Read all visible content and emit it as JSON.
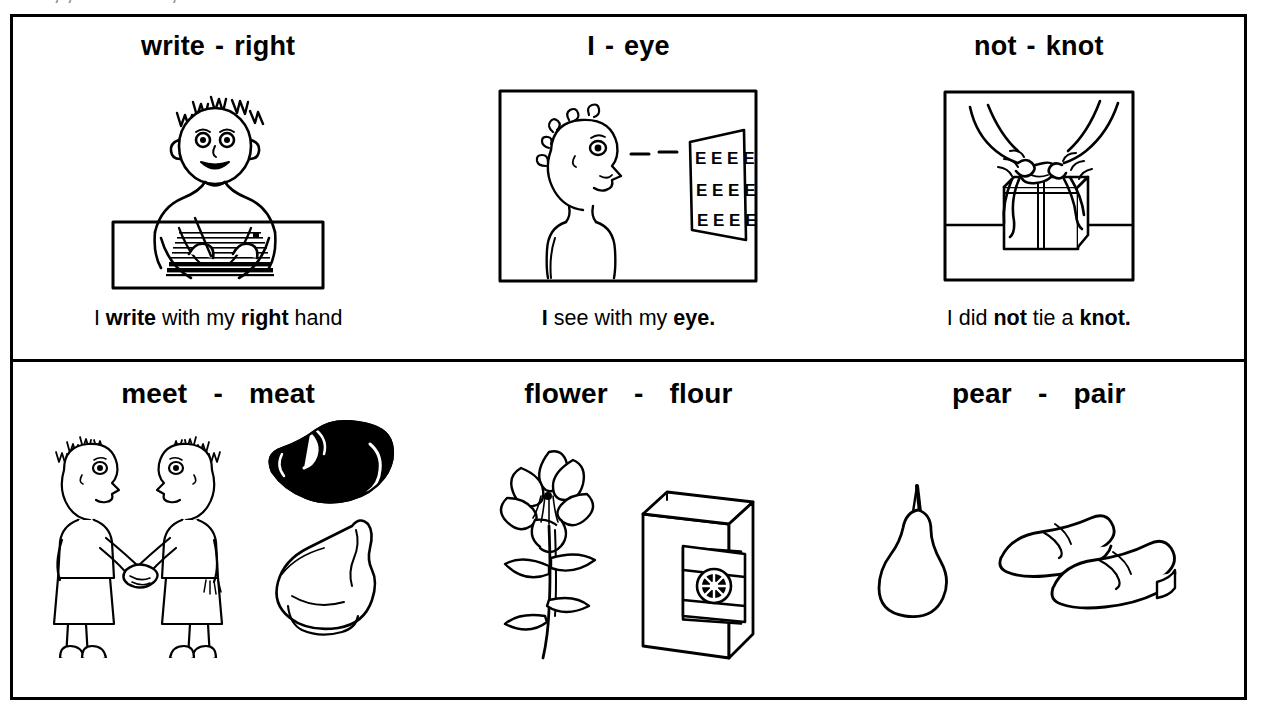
{
  "clipped_top_text": "· ,  ,· · ·   ·  ·   ·  ·  ,· · ·",
  "worksheet": {
    "rows": [
      {
        "cells": [
          {
            "word_a": "write",
            "dash": "-",
            "word_b": "right",
            "picture": "person-writing-at-desk",
            "caption": {
              "parts": [
                {
                  "text": "I ",
                  "bold": false
                },
                {
                  "text": "write",
                  "bold": true
                },
                {
                  "text": " with my ",
                  "bold": false
                },
                {
                  "text": "right",
                  "bold": true
                },
                {
                  "text": " hand",
                  "bold": false
                }
              ]
            }
          },
          {
            "word_a": "I",
            "dash": "-",
            "word_b": "eye",
            "picture": "person-reading-eye-chart",
            "eye_chart_rows": [
              "EEEE",
              "EEEE",
              "EEEE"
            ],
            "caption": {
              "parts": [
                {
                  "text": "I",
                  "bold": true
                },
                {
                  "text": " see with my ",
                  "bold": false
                },
                {
                  "text": "eye.",
                  "bold": true
                }
              ]
            }
          },
          {
            "word_a": "not",
            "dash": "-",
            "word_b": "knot",
            "picture": "hands-tying-knot-on-gift",
            "caption": {
              "parts": [
                {
                  "text": "I did ",
                  "bold": false
                },
                {
                  "text": "not",
                  "bold": true
                },
                {
                  "text": " tie a ",
                  "bold": false
                },
                {
                  "text": "knot.",
                  "bold": true
                }
              ]
            }
          }
        ]
      },
      {
        "cells": [
          {
            "word_a": "meet",
            "dash": "-",
            "word_b": "meat",
            "picture": "two-people-shaking-hands-and-meat-cuts",
            "caption": null
          },
          {
            "word_a": "flower",
            "dash": "-",
            "word_b": "flour",
            "picture": "lily-flower-and-flour-bag",
            "caption": null
          },
          {
            "word_a": "pear",
            "dash": "-",
            "word_b": "pair",
            "picture": "pear-fruit-and-pair-of-shoes",
            "caption": null
          }
        ]
      }
    ]
  },
  "colors": {
    "ink": "#000000",
    "paper": "#ffffff"
  }
}
